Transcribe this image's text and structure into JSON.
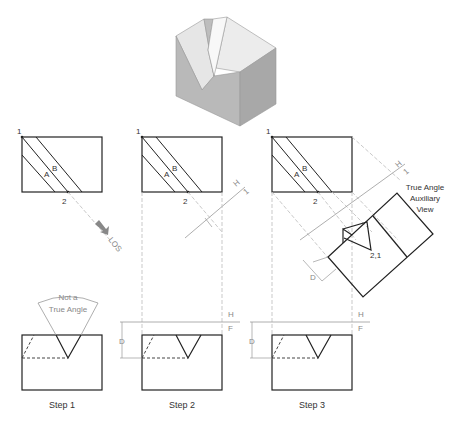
{
  "figure": {
    "steps": [
      {
        "caption": "Step 1",
        "top_labels": {
          "p1": "1",
          "p2": "2",
          "a": "A",
          "b": "B"
        },
        "annotation": [
          "Not a",
          "True Angle"
        ],
        "los_label": "LOS"
      },
      {
        "caption": "Step 2",
        "top_labels": {
          "p1": "1",
          "p2": "2",
          "a": "A",
          "b": "B"
        },
        "fold_top": {
          "h": "H",
          "one": "1"
        },
        "fold_front": {
          "h": "H",
          "f": "F"
        },
        "dim": "D",
        "aux_dim": "D"
      },
      {
        "caption": "Step 3",
        "top_labels": {
          "p1": "1",
          "p2": "2",
          "a": "A",
          "b": "B"
        },
        "fold_top": {
          "h": "H",
          "one": "1"
        },
        "fold_front": {
          "h": "H",
          "f": "F"
        },
        "dim": "D",
        "aux_dim": "D",
        "aux_point": "2,1",
        "aux_title": [
          "True Angle",
          "Auxiliary",
          "View"
        ]
      }
    ]
  }
}
